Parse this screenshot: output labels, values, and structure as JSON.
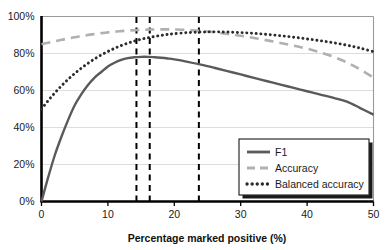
{
  "chart_data": {
    "type": "line",
    "title": "",
    "xlabel": "Percentage marked positive (%)",
    "ylabel": "",
    "xlim": [
      0,
      50
    ],
    "ylim": [
      0,
      100
    ],
    "grid": true,
    "grid_axis": "y",
    "legend_position": "lower-right",
    "x_ticks": [
      0,
      10,
      20,
      30,
      40,
      50
    ],
    "x_tick_labels": [
      "0",
      "10",
      "20",
      "30",
      "40",
      "50"
    ],
    "y_ticks": [
      0,
      20,
      40,
      60,
      80,
      100
    ],
    "y_tick_labels": [
      "0%",
      "20%",
      "40%",
      "60%",
      "80%",
      "100%"
    ],
    "x": [
      0,
      1,
      2,
      3,
      4,
      5,
      6,
      7,
      8,
      9,
      10,
      11,
      12,
      13,
      14,
      15,
      16,
      17,
      18,
      19,
      20,
      22,
      24,
      26,
      28,
      30,
      32,
      34,
      36,
      38,
      40,
      42,
      44,
      46,
      48,
      50
    ],
    "series": [
      {
        "name": "F1",
        "style": "solid",
        "color": "#5a5a5a",
        "values": [
          0,
          13,
          25,
          35,
          44,
          52,
          58,
          63,
          67,
          70,
          73,
          75,
          76.5,
          77.5,
          78,
          78.2,
          78.2,
          78,
          77.7,
          77.3,
          76.8,
          75.5,
          74,
          72.3,
          70.5,
          68.7,
          66.8,
          65,
          63.2,
          61.4,
          59.6,
          57.8,
          56,
          54,
          50.5,
          47
        ]
      },
      {
        "name": "Accuracy",
        "style": "dashed",
        "color": "#b0b0b0",
        "values": [
          85,
          85.8,
          86.6,
          87.4,
          88.1,
          88.8,
          89.4,
          90,
          90.5,
          91,
          91.4,
          91.8,
          92.1,
          92.4,
          92.6,
          92.8,
          92.9,
          93,
          93.05,
          93.05,
          93,
          92.7,
          92.2,
          91.5,
          90.6,
          89.6,
          88.4,
          87.1,
          85.7,
          84.2,
          82.6,
          80.6,
          78.2,
          75.2,
          71.4,
          67
        ]
      },
      {
        "name": "Balanced accuracy",
        "style": "dotted",
        "color": "#2b2b2b",
        "values": [
          50,
          54.5,
          58.7,
          62.5,
          66,
          69.2,
          72.1,
          74.7,
          77.1,
          79.2,
          81.1,
          82.8,
          84.3,
          85.6,
          86.7,
          87.7,
          88.5,
          89.2,
          89.8,
          90.3,
          90.7,
          91.3,
          91.6,
          91.7,
          91.6,
          91.3,
          90.9,
          90.3,
          89.6,
          88.8,
          87.9,
          86.9,
          85.8,
          84.5,
          82.9,
          81
        ]
      }
    ],
    "vertical_lines": [
      {
        "x": 14.3,
        "style": "dashed",
        "color": "#000000"
      },
      {
        "x": 16.3,
        "style": "dashed",
        "color": "#000000"
      },
      {
        "x": 23.7,
        "style": "dashed",
        "color": "#000000"
      }
    ],
    "legend_entries": [
      "F1",
      "Accuracy",
      "Balanced accuracy"
    ]
  },
  "axes": {
    "x_title": "Percentage marked positive (%)"
  },
  "legend": {
    "items": [
      {
        "label": "F1"
      },
      {
        "label": "Accuracy"
      },
      {
        "label": "Balanced accuracy"
      }
    ]
  },
  "colors": {
    "f1": "#5a5a5a",
    "accuracy": "#b0b0b0",
    "balanced_accuracy": "#2b2b2b",
    "threshold_line": "#000000",
    "grid": "#d9d9d9",
    "axis": "#000000",
    "background": "#ffffff"
  }
}
